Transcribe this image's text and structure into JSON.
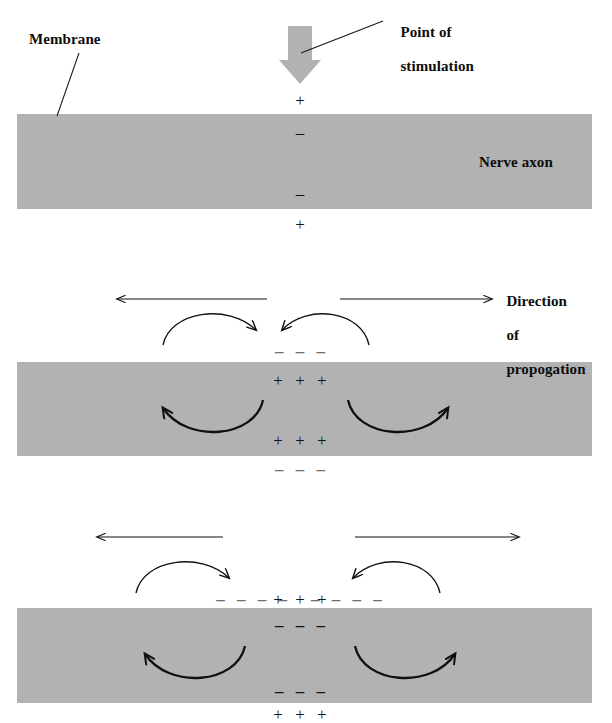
{
  "figure": {
    "background_color": "#ffffff",
    "axon_fill_color": "#b2b2b2",
    "ink_color": "#101010",
    "faint_ink_color": "#6e6e6e",
    "width": 612,
    "height": 723
  },
  "labels": {
    "membrane": "Membrane",
    "point_of_stimulation_line1": "Point of",
    "point_of_stimulation_line2": "stimulation",
    "nerve_axon": "Nerve axon",
    "direction_line1": "Direction",
    "direction_line2": "of",
    "direction_line3": "propogation"
  },
  "panels": [
    {
      "id": "panel-resting-stimulated",
      "index": 1,
      "caption": "Resting axon at the instant of stimulation",
      "stimulus_arrow": {
        "present": true,
        "direction": "down",
        "color": "#b2b2b2"
      },
      "charges": [
        {
          "position": "above-membrane",
          "symbols": "+",
          "polarity": "positive",
          "tone": "dark"
        },
        {
          "position": "inside-top",
          "symbols": "–",
          "polarity": "negative",
          "tone": "dark"
        },
        {
          "position": "inside-bottom",
          "symbols": "–",
          "polarity": "negative",
          "tone": "dark"
        },
        {
          "position": "below-membrane",
          "symbols": "+",
          "polarity": "positive",
          "tone": "dark"
        }
      ],
      "propagation_arrows": {
        "present": false
      },
      "current_loops": {
        "present": false
      }
    },
    {
      "id": "panel-depolarized",
      "index": 2,
      "caption": "Local depolarization and circulating current at the point of stimulation",
      "stimulus_arrow": {
        "present": false
      },
      "charges": [
        {
          "position": "above-membrane",
          "symbols": "– – –",
          "polarity": "negative",
          "tone": "light"
        },
        {
          "position": "inside-top",
          "symbols": "+ + +",
          "polarity": "positive",
          "tone": "dark"
        },
        {
          "position": "inside-bottom",
          "symbols": "+ + +",
          "polarity": "positive",
          "tone": "dark"
        },
        {
          "position": "below-membrane",
          "symbols": "– – –",
          "polarity": "negative",
          "tone": "light"
        }
      ],
      "propagation_arrows": {
        "present": true,
        "left": {
          "direction": "left",
          "label": "spreads left"
        },
        "right": {
          "direction": "right",
          "label": "spreads right"
        }
      },
      "current_loops": {
        "present": true,
        "count": 4,
        "description": "two outside-membrane loops curving inward and two inside-axon loops curving outward"
      }
    },
    {
      "id": "panel-propagating",
      "index": 3,
      "caption": "Impulse spreading outward in both directions from the stimulus",
      "stimulus_arrow": {
        "present": false
      },
      "charges": [
        {
          "position": "above-membrane-left",
          "symbols": "– – – –",
          "polarity": "negative",
          "tone": "light"
        },
        {
          "position": "above-membrane-center",
          "symbols": "+ + +",
          "polarity": "positive",
          "tone": "dark"
        },
        {
          "position": "above-membrane-right",
          "symbols": "– – – –",
          "polarity": "negative",
          "tone": "light"
        },
        {
          "position": "inside-top",
          "symbols": "– – –",
          "polarity": "negative",
          "tone": "dark"
        },
        {
          "position": "inside-bottom",
          "symbols": "– – –",
          "polarity": "negative",
          "tone": "dark"
        },
        {
          "position": "below-membrane",
          "symbols": "+ + +",
          "polarity": "positive",
          "tone": "dark"
        }
      ],
      "propagation_arrows": {
        "present": true,
        "left": {
          "direction": "left",
          "label": "spreads left"
        },
        "right": {
          "direction": "right",
          "label": "spreads right"
        }
      },
      "current_loops": {
        "present": true,
        "count": 4,
        "description": "two outside-membrane loops curving inward and two inside-axon loops curving outward"
      }
    }
  ]
}
